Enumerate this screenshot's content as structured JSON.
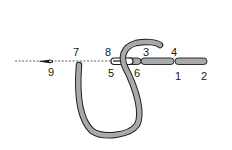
{
  "diagram": {
    "type": "stitch-diagram",
    "colors": {
      "thread_fill": "#a9a9a9",
      "thread_outline": "#1a1a1a",
      "guide_line": "#333333",
      "background": "#ffffff"
    },
    "labels": [
      {
        "id": "1",
        "text": "1"
      },
      {
        "id": "2",
        "text": "2"
      },
      {
        "id": "3",
        "text": "3"
      },
      {
        "id": "4",
        "text": "4"
      },
      {
        "id": "5",
        "text": "5"
      },
      {
        "id": "6",
        "text": "6"
      },
      {
        "id": "7",
        "text": "7"
      },
      {
        "id": "8",
        "text": "8"
      },
      {
        "id": "9",
        "text": "9"
      }
    ]
  }
}
